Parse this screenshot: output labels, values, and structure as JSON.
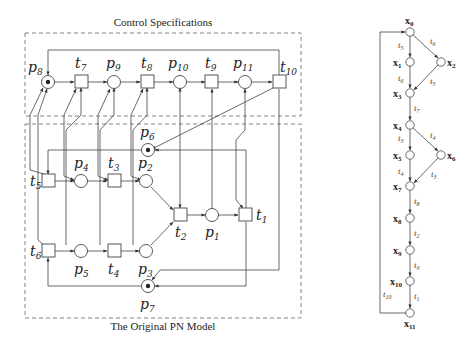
{
  "left_figure": {
    "top_caption": "Control Specifications",
    "bottom_caption": "The Original PN Model",
    "places": [
      {
        "id": "p8",
        "label": "p",
        "sub": "8",
        "token": true
      },
      {
        "id": "p9",
        "label": "p",
        "sub": "9",
        "token": false
      },
      {
        "id": "p10",
        "label": "p",
        "sub": "10",
        "token": false
      },
      {
        "id": "p11",
        "label": "p",
        "sub": "11",
        "token": false
      },
      {
        "id": "p6",
        "label": "p",
        "sub": "6",
        "token": true
      },
      {
        "id": "p4",
        "label": "p",
        "sub": "4",
        "token": false
      },
      {
        "id": "p2",
        "label": "p",
        "sub": "2",
        "token": false
      },
      {
        "id": "p1",
        "label": "p",
        "sub": "1",
        "token": false
      },
      {
        "id": "p5",
        "label": "p",
        "sub": "5",
        "token": false
      },
      {
        "id": "p3",
        "label": "p",
        "sub": "3",
        "token": false
      },
      {
        "id": "p7",
        "label": "p",
        "sub": "7",
        "token": true
      }
    ],
    "transitions": [
      {
        "id": "t7",
        "label": "t",
        "sub": "7"
      },
      {
        "id": "t8",
        "label": "t",
        "sub": "8"
      },
      {
        "id": "t9",
        "label": "t",
        "sub": "9"
      },
      {
        "id": "t10",
        "label": "t",
        "sub": "10"
      },
      {
        "id": "t5",
        "label": "t",
        "sub": "5"
      },
      {
        "id": "t3",
        "label": "t",
        "sub": "3"
      },
      {
        "id": "t2",
        "label": "t",
        "sub": "2"
      },
      {
        "id": "t1",
        "label": "t",
        "sub": "1"
      },
      {
        "id": "t6",
        "label": "t",
        "sub": "6"
      },
      {
        "id": "t4",
        "label": "t",
        "sub": "4"
      }
    ]
  },
  "right_figure": {
    "states": [
      "x0",
      "x1",
      "x2",
      "x3",
      "x4",
      "x5",
      "x6",
      "x7",
      "x8",
      "x9",
      "x10",
      "x11"
    ],
    "state_labels": {
      "x0": "x",
      "x0_sub": "0",
      "x1_sub": "1",
      "x2_sub": "2",
      "x3_sub": "3",
      "x4_sub": "4",
      "x5_sub": "5",
      "x6_sub": "6",
      "x7_sub": "7",
      "x8_sub": "8",
      "x9_sub": "9",
      "x10_sub": "10",
      "x11_sub": "11"
    },
    "edges": [
      {
        "from": "x0",
        "to": "x1",
        "label": "t5"
      },
      {
        "from": "x0",
        "to": "x2",
        "label": "t6"
      },
      {
        "from": "x1",
        "to": "x3",
        "label": "t6"
      },
      {
        "from": "x2",
        "to": "x3",
        "label": "t5"
      },
      {
        "from": "x3",
        "to": "x4",
        "label": "t7"
      },
      {
        "from": "x4",
        "to": "x5",
        "label": "t3"
      },
      {
        "from": "x4",
        "to": "x6",
        "label": "t4"
      },
      {
        "from": "x5",
        "to": "x7",
        "label": "t4"
      },
      {
        "from": "x6",
        "to": "x7",
        "label": "t3"
      },
      {
        "from": "x7",
        "to": "x8",
        "label": "t8"
      },
      {
        "from": "x8",
        "to": "x9",
        "label": "t2"
      },
      {
        "from": "x9",
        "to": "x10",
        "label": "t9"
      },
      {
        "from": "x10",
        "to": "x11",
        "label": "t1"
      },
      {
        "from": "x11",
        "to": "x0",
        "label": "t10"
      }
    ]
  }
}
